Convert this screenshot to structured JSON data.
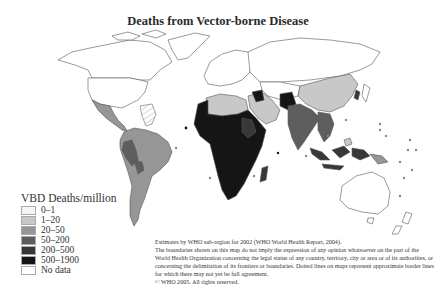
{
  "title": "Deaths from Vector-borne Disease",
  "legend": {
    "title": "VBD Deaths/million",
    "items": [
      {
        "label": "0–1",
        "color": "#f4f4f4"
      },
      {
        "label": "1–20",
        "color": "#c8c8c8"
      },
      {
        "label": "20–50",
        "color": "#969696"
      },
      {
        "label": "50–200",
        "color": "#5e5e5e"
      },
      {
        "label": "200–500",
        "color": "#383838"
      },
      {
        "label": "500–1900",
        "color": "#151515"
      },
      {
        "label": "No data",
        "color": "#ffffff"
      }
    ]
  },
  "notes": {
    "line1": "Estimates by WHO sub-region for 2002 (WHO World Health Report, 2004).",
    "line2": "The boundaries shown on this map do not imply the expression of any opinion whatsoever on the part of the World Health Organization concerning the legal status of any country, territory, city or area or of its authorities, or concerning the delimitation of its frontiers or boundaries. Dotted lines on maps represent approximate border lines for which there may not yet be full agreement.",
    "line3": "© WHO 2005. All rights reserved."
  },
  "regions": {
    "north_america": "0–1",
    "central_america": "20–50",
    "south_america": "20–50",
    "europe_russia": "0–1",
    "north_africa": "1–20",
    "sub_saharan_africa": "500–1900",
    "middle_east": "1–20",
    "south_asia": "50–200",
    "china": "1–20",
    "southeast_asia": "200–500",
    "australia": "0–1"
  }
}
